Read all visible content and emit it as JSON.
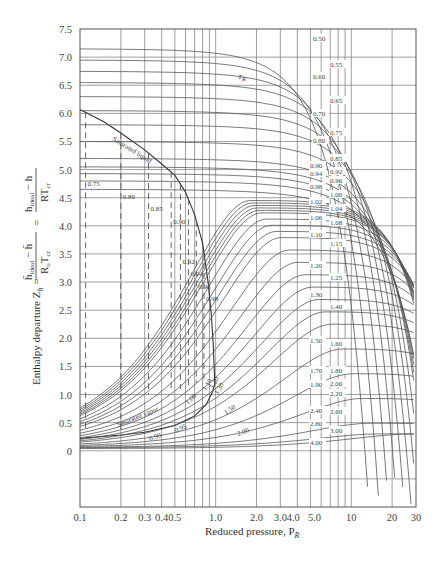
{
  "chart_data": {
    "type": "line",
    "title": "",
    "xlabel": "Reduced pressure, P_R",
    "ylabel": "Enthalpy departure Z_h = (h̄_ideal − h̄)/(R_u T_cr) = (h_ideal − h)/(R T_cr)",
    "xscale": "log",
    "xlim": [
      0.1,
      30
    ],
    "ylim": [
      -1.0,
      7.5
    ],
    "grid": true,
    "x_ticks": [
      "0.1",
      "0.2",
      "0.3",
      "0.4",
      "0.5",
      "1.0",
      "2.0",
      "3.0",
      "4.0",
      "5.0",
      "10",
      "20",
      "30"
    ],
    "y_ticks": [
      "7.5",
      "7.0",
      "6.5",
      "6.0",
      "5.5",
      "5.0",
      "4.5",
      "4.0",
      "3.5",
      "3.0",
      "2.5",
      "2.0",
      "1.5",
      "1.0",
      "0.5",
      "0"
    ],
    "x_gridlines": [
      0.2,
      0.3,
      0.4,
      0.5,
      0.6,
      0.7,
      0.8,
      0.9,
      1.0,
      2,
      3,
      4,
      5,
      6,
      7,
      8,
      9,
      10,
      20
    ],
    "parameter_label": "T_R",
    "series_label_unit": "Reduced temperature T_R",
    "upper_isotherms": [
      {
        "name": "0.50",
        "y_low": 7.15
      },
      {
        "name": "0.55",
        "y_low": 6.95
      },
      {
        "name": "0.60",
        "y_low": 6.75
      },
      {
        "name": "0.65",
        "y_low": 6.55
      },
      {
        "name": "0.70",
        "y_low": 6.3
      },
      {
        "name": "0.75",
        "y_low": 6.05
      },
      {
        "name": "0.80",
        "y_low": 5.8
      },
      {
        "name": "0.85",
        "y_low": 5.5
      },
      {
        "name": "0.90",
        "y_low": 5.2
      },
      {
        "name": "0.92",
        "y_low": 5.05
      },
      {
        "name": "0.94",
        "y_low": 4.93
      },
      {
        "name": "0.96",
        "y_low": 4.8
      },
      {
        "name": "0.98",
        "y_low": 4.65
      },
      {
        "name": "1.00",
        "y_low": 4.5
      },
      {
        "name": "1.02",
        "y_low": 4.35
      },
      {
        "name": "1.04",
        "y_low": 4.2
      },
      {
        "name": "1.06",
        "y_low": 4.05
      },
      {
        "name": "1.08",
        "y_low": 3.9
      },
      {
        "name": "1.10",
        "y_low": 3.75
      },
      {
        "name": "1.15",
        "y_low": 3.4
      },
      {
        "name": "1.20",
        "y_low": 3.05
      },
      {
        "name": "1.25",
        "y_low": 2.8
      },
      {
        "name": "1.30",
        "y_low": 2.55
      },
      {
        "name": "1.40",
        "y_low": 2.2
      },
      {
        "name": "1.50",
        "y_low": 1.9
      },
      {
        "name": "1.60",
        "y_low": 1.7
      },
      {
        "name": "1.70",
        "y_low": 1.5
      },
      {
        "name": "1.80",
        "y_low": 1.35
      },
      {
        "name": "1.90",
        "y_low": 1.25
      },
      {
        "name": "2.00",
        "y_low": 1.15
      },
      {
        "name": "2.20",
        "y_low": 1.0
      },
      {
        "name": "2.40",
        "y_low": 0.85
      },
      {
        "name": "2.60",
        "y_low": 0.75
      },
      {
        "name": "2.80",
        "y_low": 0.65
      },
      {
        "name": "3.00",
        "y_low": 0.55
      },
      {
        "name": "4.00",
        "y_low": 0.3
      }
    ],
    "dashed_liquid_isotherms": [
      {
        "name": "0.75",
        "P_sat": 0.11
      },
      {
        "name": "0.80",
        "P_sat": 0.2
      },
      {
        "name": "0.85",
        "P_sat": 0.32
      },
      {
        "name": "0.90",
        "P_sat": 0.47
      },
      {
        "name": "0.92",
        "P_sat": 0.55
      },
      {
        "name": "0.94",
        "P_sat": 0.63
      },
      {
        "name": "0.96",
        "P_sat": 0.72
      },
      {
        "name": "0.98",
        "P_sat": 0.82
      }
    ],
    "vapor_isotherm_labels": [
      "0.90",
      "0.95",
      "1.00",
      "1.10",
      "1.20",
      "1.30",
      "1.50",
      "2.00"
    ],
    "annotations": [
      "Saturated liquid",
      "Saturated vapor",
      "T_R"
    ]
  },
  "labels": {
    "x_axis": "Reduced pressure, P",
    "x_axis_sub": "R",
    "y_axis_main": "Enthalpy departure Z",
    "y_axis_sub": "h",
    "sat_liquid": "Saturated liquid",
    "sat_vapor": "Saturated vapor",
    "tr_symbol": "T",
    "tr_sub": "R"
  }
}
